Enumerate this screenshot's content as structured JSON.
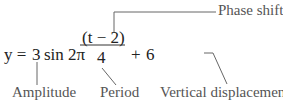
{
  "equation": {
    "lhs": "y =",
    "amplitude": "3",
    "func": "sin 2π",
    "numerator": "(t − 2)",
    "denominator": "4",
    "plus": "+",
    "vertical": "6"
  },
  "labels": {
    "phase_shift": "Phase shift",
    "amplitude": "Amplitude",
    "period": "Period",
    "vertical_displacement": "Vertical displacement"
  }
}
